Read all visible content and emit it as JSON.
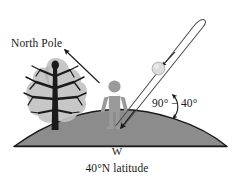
{
  "figure": {
    "title_alt": "Solar noon sun angle at 40 degrees north latitude",
    "labels": {
      "north_pole": "North Pole",
      "angle": "90° − 40°",
      "cardinal_west": "W",
      "latitude": "40°N latitude"
    },
    "colors": {
      "background": "#ffffff",
      "ink": "#1a1a1a",
      "ground_fill": "#8f8f8f",
      "ground_stroke": "#1a1a1a",
      "person_fill": "#9a9a9a",
      "tree_foliage": "#c2c2c2",
      "tree_trunk": "#1a1a1a",
      "sun_fill": "#dcdcdc",
      "sun_stroke": "#9a9a9a",
      "beam_stroke": "#4a4a4a"
    },
    "elements": {
      "ground": "hill-dome",
      "person": "human-figure-silhouette",
      "tree": "bare-tree-with-foliage",
      "sun": "sun-disk",
      "sun_beam": "incoming-solar-beam",
      "north_pole_arrow": "arrow-to-north-pole",
      "angle_arc": "angle-arc-double-arrow"
    }
  }
}
